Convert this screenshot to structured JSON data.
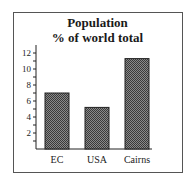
{
  "chart_data": {
    "type": "bar",
    "title": "Population",
    "subtitle": "% of world total",
    "categories": [
      "EC",
      "USA",
      "Cairns"
    ],
    "values": [
      7.0,
      5.2,
      11.3
    ],
    "xlabel": "",
    "ylabel": "",
    "ylim": [
      0,
      13
    ],
    "yticks_labeled": [
      2,
      4,
      6,
      8,
      10,
      12
    ],
    "minor_ticks_step": 1,
    "grid": false,
    "legend": null,
    "bar_fill": "crosshatch dark gray"
  },
  "colors": {
    "bar": "#6b6b6b",
    "bar_border": "#222222",
    "axis": "#222222",
    "frame": "#555555"
  }
}
